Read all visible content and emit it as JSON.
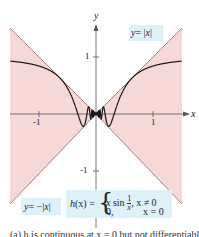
{
  "chart_data": {
    "type": "line",
    "title": "",
    "xlabel": "x",
    "ylabel": "y",
    "xlim": [
      -1.5,
      1.5
    ],
    "ylim": [
      -1.55,
      1.55
    ],
    "grid": false,
    "x_ticks": [
      -1,
      1
    ],
    "x_tick_labels": [
      "-1",
      "1"
    ],
    "y_ticks": [
      1,
      -1
    ],
    "y_tick_labels": [
      "1",
      "-1"
    ],
    "series": [
      {
        "name": "y = |x|",
        "role": "upper bound",
        "color": "#b08080"
      },
      {
        "name": "y = -|x|",
        "role": "lower bound",
        "color": "#b08080"
      },
      {
        "name": "h(x) = x sin(1/x), x != 0; 0, x = 0",
        "role": "function",
        "color": "#1a1a1a"
      }
    ],
    "shaded_region": {
      "description": "region between y=|x| and y=-|x| (|y| <= |x|)",
      "color": "#f6d8d8"
    },
    "annotations": [
      {
        "text": "y = |x|",
        "position": "upper right"
      },
      {
        "text": "y = -|x|",
        "position": "lower left"
      },
      {
        "text": "h(x) = { x sin 1/x, x ≠ 0 ; 0, x = 0 }",
        "position": "bottom center"
      }
    ]
  },
  "axes": {
    "x_label": "x",
    "y_label": "y",
    "tick_x_neg1": "-1",
    "tick_x_pos1": "1",
    "tick_y_pos1": "1",
    "tick_y_neg1": "-1"
  },
  "labels": {
    "upper_bound_y": "y",
    "upper_bound_eq": "= |",
    "upper_bound_x": "x",
    "upper_bound_end": "|",
    "lower_bound_y": "y",
    "lower_bound_eq": "= −|",
    "lower_bound_x": "x",
    "lower_bound_end": "|",
    "h_name": "h",
    "h_arg": "(x) =",
    "h_case1_expr": "x",
    "h_case1_sin": "sin",
    "h_case1_num": "1",
    "h_case1_den": "x",
    "h_case1_cond": ", x ≠ 0",
    "h_case2_expr": "0,",
    "h_case2_cond": "x = 0"
  },
  "caption": "(a) h is continuous at x = 0 but not differentiable"
}
